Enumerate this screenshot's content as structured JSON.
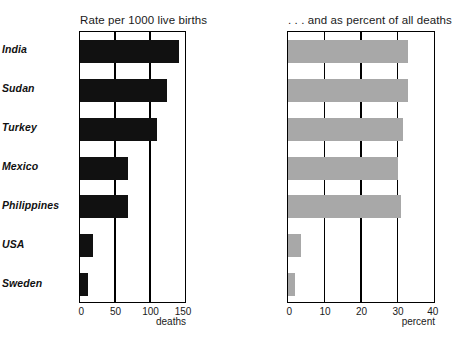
{
  "chart_data": {
    "type": "bar",
    "orientation": "horizontal",
    "categories": [
      "India",
      "Sudan",
      "Turkey",
      "Mexico",
      "Philippines",
      "USA",
      "Sweden"
    ],
    "panels": [
      {
        "title": "Rate per 1000 live births",
        "xlabel": "deaths",
        "ylabel": "",
        "xlim": [
          0,
          150
        ],
        "xticks": [
          0,
          50,
          100,
          150
        ],
        "xticklabels": [
          "0",
          "50",
          "100",
          "150"
        ],
        "grid": true,
        "bar_color": "#111111",
        "values": [
          142,
          124,
          110,
          68,
          69,
          18,
          12
        ]
      },
      {
        "title": ". . . and as percent of all deaths",
        "xlabel": "percent",
        "ylabel": "",
        "xlim": [
          0,
          40
        ],
        "xticks": [
          0,
          10,
          20,
          30,
          40
        ],
        "xticklabels": [
          "0",
          "10",
          "20",
          "30",
          "40"
        ],
        "grid": true,
        "bar_color": "#a8a8a8",
        "values": [
          33,
          33,
          31.5,
          30,
          31,
          3.5,
          2
        ]
      }
    ],
    "legend": "none",
    "caption": ""
  },
  "colors": {
    "bar_dark": "#111111",
    "bar_grey": "#a8a8a8",
    "frame": "#000000",
    "background": "#ffffff"
  }
}
